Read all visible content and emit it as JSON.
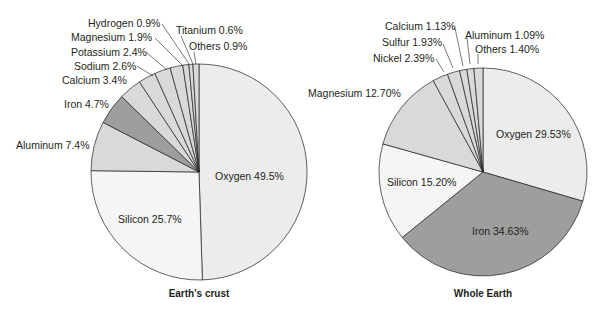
{
  "chart_data": [
    {
      "type": "pie",
      "title": "Earth's crust",
      "center": [
        199,
        172
      ],
      "radius": 108,
      "slices": [
        {
          "label": "Oxygen",
          "value": 49.5,
          "text": "Oxygen 49.5%",
          "color": "#ececec"
        },
        {
          "label": "Silicon",
          "value": 25.7,
          "text": "Silicon 25.7%",
          "color": "#f5f5f5"
        },
        {
          "label": "Aluminum",
          "value": 7.4,
          "text": "Aluminum 7.4%",
          "color": "#d9d9d9"
        },
        {
          "label": "Iron",
          "value": 4.7,
          "text": "Iron 4.7%",
          "color": "#9e9e9e"
        },
        {
          "label": "Calcium",
          "value": 3.4,
          "text": "Calcium 3.4%",
          "color": "#d9d9d9"
        },
        {
          "label": "Sodium",
          "value": 2.6,
          "text": "Sodium 2.6%",
          "color": "#d9d9d9"
        },
        {
          "label": "Potassium",
          "value": 2.4,
          "text": "Potassium 2.4%",
          "color": "#d9d9d9"
        },
        {
          "label": "Magnesium",
          "value": 1.9,
          "text": "Magnesium 1.9%",
          "color": "#d9d9d9"
        },
        {
          "label": "Hydrogen",
          "value": 0.9,
          "text": "Hydrogen 0.9%",
          "color": "#d9d9d9"
        },
        {
          "label": "Titanium",
          "value": 0.6,
          "text": "Titanium 0.6%",
          "color": "#d9d9d9"
        },
        {
          "label": "Others",
          "value": 0.9,
          "text": "Others 0.9%",
          "color": "#d9d9d9"
        }
      ]
    },
    {
      "type": "pie",
      "title": "Whole Earth",
      "center": [
        483,
        172
      ],
      "radius": 104,
      "slices": [
        {
          "label": "Oxygen",
          "value": 29.53,
          "text": "Oxygen 29.53%",
          "color": "#ececec"
        },
        {
          "label": "Iron",
          "value": 34.63,
          "text": "Iron 34.63%",
          "color": "#9e9e9e"
        },
        {
          "label": "Silicon",
          "value": 15.2,
          "text": "Silicon 15.20%",
          "color": "#f5f5f5"
        },
        {
          "label": "Magnesium",
          "value": 12.7,
          "text": "Magnesium 12.70%",
          "color": "#d9d9d9"
        },
        {
          "label": "Nickel",
          "value": 2.39,
          "text": "Nickel 2.39%",
          "color": "#d9d9d9"
        },
        {
          "label": "Sulfur",
          "value": 1.93,
          "text": "Sulfur 1.93%",
          "color": "#d9d9d9"
        },
        {
          "label": "Calcium",
          "value": 1.13,
          "text": "Calcium 1.13%",
          "color": "#d9d9d9"
        },
        {
          "label": "Aluminum",
          "value": 1.09,
          "text": "Aluminum 1.09%",
          "color": "#d9d9d9"
        },
        {
          "label": "Others",
          "value": 1.4,
          "text": "Others 1.40%",
          "color": "#d9d9d9"
        }
      ]
    }
  ],
  "labels": {
    "crust": {
      "title": "Earth's crust",
      "oxygen": "Oxygen 49.5%",
      "silicon": "Silicon 25.7%",
      "aluminum": "Aluminum 7.4%",
      "iron": "Iron 4.7%",
      "calcium": "Calcium 3.4%",
      "sodium": "Sodium 2.6%",
      "potassium": "Potassium 2.4%",
      "magnesium": "Magnesium 1.9%",
      "hydrogen": "Hydrogen 0.9%",
      "titanium": "Titanium 0.6%",
      "others": "Others 0.9%"
    },
    "whole": {
      "title": "Whole Earth",
      "oxygen": "Oxygen 29.53%",
      "iron": "Iron 34.63%",
      "silicon": "Silicon 15.20%",
      "magnesium": "Magnesium 12.70%",
      "nickel": "Nickel 2.39%",
      "sulfur": "Sulfur 1.93%",
      "calcium": "Calcium 1.13%",
      "aluminum": "Aluminum 1.09%",
      "others": "Others 1.40%"
    }
  }
}
